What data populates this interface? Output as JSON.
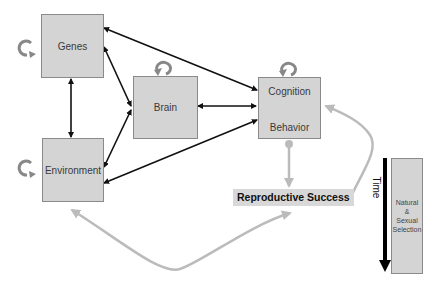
{
  "diagram": {
    "nodes": {
      "genes": {
        "label": "Genes"
      },
      "brain": {
        "label": "Brain"
      },
      "cognition": {
        "label": "Cognition"
      },
      "behavior": {
        "label": "Behavior"
      },
      "environment": {
        "label": "Environment"
      },
      "reproductive_success": {
        "label": "Reproductive Success"
      },
      "selection": {
        "line1": "Natural",
        "line2": "&",
        "line3": "Sexual",
        "line4": "Selection"
      }
    },
    "time_label": "Time",
    "edges": [
      {
        "from": "genes",
        "to": "environment",
        "type": "bidirectional",
        "color": "#111111"
      },
      {
        "from": "genes",
        "to": "brain",
        "type": "bidirectional",
        "color": "#111111"
      },
      {
        "from": "genes",
        "to": "cognition-behavior",
        "type": "bidirectional",
        "color": "#111111"
      },
      {
        "from": "environment",
        "to": "brain",
        "type": "bidirectional",
        "color": "#111111"
      },
      {
        "from": "environment",
        "to": "cognition-behavior",
        "type": "bidirectional",
        "color": "#111111"
      },
      {
        "from": "brain",
        "to": "cognition-behavior",
        "type": "bidirectional",
        "color": "#111111"
      },
      {
        "from": "cognition",
        "to": "behavior",
        "type": "bidirectional",
        "color": "#111111"
      },
      {
        "from": "cognition-behavior",
        "to": "reproductive-success",
        "type": "directed",
        "color": "#bbbbbb"
      },
      {
        "from": "reproductive-success",
        "to": "cognition-behavior",
        "type": "feedback-curve",
        "color": "#bbbbbb"
      },
      {
        "from": "environment",
        "to": "reproductive-success",
        "type": "bidirectional-curve",
        "color": "#bbbbbb"
      }
    ],
    "self_loops": [
      "genes",
      "brain",
      "cognition-behavior",
      "environment"
    ],
    "colors": {
      "box_fill": "#d4d4d4",
      "box_border": "#8a8a8a",
      "arrow_dark": "#111111",
      "arrow_light": "#bbbbbb",
      "loop": "#888888"
    }
  }
}
